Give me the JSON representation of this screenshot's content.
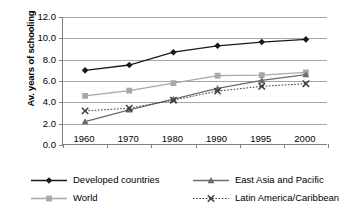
{
  "chart_data": {
    "type": "line",
    "title": "",
    "xlabel": "",
    "ylabel": "Av. years of schooling",
    "categories": [
      "1960",
      "1970",
      "1980",
      "1990",
      "1995",
      "2000"
    ],
    "ylim": [
      0.0,
      12.0
    ],
    "ytick_labels": [
      "0.0",
      "2.0",
      "4.0",
      "6.0",
      "8.0",
      "10.0",
      "12.0"
    ],
    "ytick_values": [
      0.0,
      2.0,
      4.0,
      6.0,
      8.0,
      10.0,
      12.0
    ],
    "grid": true,
    "legend_position": "bottom",
    "series": [
      {
        "name": "Developed countries",
        "values": [
          7.0,
          7.5,
          8.7,
          9.3,
          9.65,
          9.9
        ],
        "color": "#1a1a1a",
        "marker": "diamond",
        "line_style": "solid"
      },
      {
        "name": "World",
        "values": [
          4.6,
          5.1,
          5.8,
          6.5,
          6.55,
          6.8
        ],
        "color": "#a8a8a8",
        "marker": "square",
        "line_style": "solid"
      },
      {
        "name": "East Asia and Pacific",
        "values": [
          2.2,
          3.3,
          4.3,
          5.3,
          6.05,
          6.6
        ],
        "color": "#6b6b6b",
        "marker": "triangle",
        "line_style": "solid"
      },
      {
        "name": "Latin America/Caribbean",
        "values": [
          3.2,
          3.45,
          4.2,
          5.05,
          5.5,
          5.75
        ],
        "color": "#3d3d3d",
        "marker": "cross",
        "line_style": "dotted"
      }
    ]
  },
  "colors": {
    "axis": "#808080",
    "gridline": "#a6a6a6",
    "background": "#ffffff",
    "text": "#000000"
  }
}
